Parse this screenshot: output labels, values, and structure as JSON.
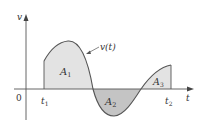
{
  "diagram": {
    "y_axis_label": "v",
    "x_axis_label": "t",
    "origin_label": "0",
    "curve_label": "v(t)",
    "t1_label": "t",
    "t1_sub": "1",
    "t2_label": "t",
    "t2_sub": "2",
    "areas": [
      {
        "label": "A",
        "sub": "1",
        "sign": "positive"
      },
      {
        "label": "A",
        "sub": "2",
        "sign": "negative"
      },
      {
        "label": "A",
        "sub": "3",
        "sign": "positive"
      }
    ],
    "colors": {
      "positive_fill": "#e3e3e3",
      "negative_fill": "#c4c4c4",
      "curve": "#555555",
      "axis": "#555555"
    }
  }
}
